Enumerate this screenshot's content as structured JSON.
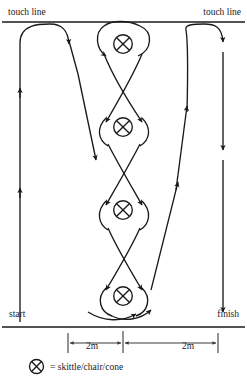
{
  "diagram": {
    "labels": {
      "touch_line_left": "touch line",
      "touch_line_right": "touch line",
      "start": "start",
      "finish": "finish"
    },
    "dimensions": [
      {
        "label": "2m"
      },
      {
        "label": "2m"
      }
    ],
    "legend": {
      "symbol_name": "cone-marker-icon",
      "text": "= skittle/chair/cone"
    },
    "markers": {
      "symbol": "circle-with-x",
      "count": 4,
      "positions": [
        {
          "cx": 123,
          "cy": 44
        },
        {
          "cx": 123,
          "cy": 127
        },
        {
          "cx": 123,
          "cy": 210
        },
        {
          "cx": 123,
          "cy": 296
        }
      ],
      "radius": 9.5
    },
    "reference_lines": {
      "touch_line": {
        "y": 22,
        "x1": 2,
        "x2": 245
      },
      "base_line": {
        "y": 327,
        "x1": 2,
        "x2": 245
      }
    },
    "colors": {
      "ink": "#1a1a1a",
      "background": "#ffffff",
      "dimension_rule": "#3a3a3a"
    }
  }
}
